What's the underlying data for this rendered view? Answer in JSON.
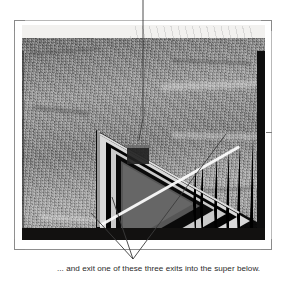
{
  "figure": {
    "caption": "... and exit one of these three exits into the super below.",
    "alt_description": "Black-and-white photograph of a triangular beehive entrance structure with nested triangular rings, apex pointing right",
    "medium": "scanned grayscale photograph",
    "colors": {
      "page_background": "#ffffff",
      "photo_midtone": "#8d8b87",
      "photo_shadow": "#121110",
      "photo_highlight": "#f4f1e8",
      "leader_line": "#3b3b3b",
      "crop_mark": "#8a8a8a",
      "caption_text": "#2a2a2a"
    },
    "annotations": {
      "top_pointer": {
        "name": "top-leader-line",
        "description": "vertical leader line from top edge down to the dark entrance block inside the triangle",
        "target": "entrance-block"
      },
      "bottom_pointer": {
        "name": "three-exit-leader-lines",
        "description": "three leader lines converging below the photograph at the caption",
        "count": 3,
        "targets": [
          "left-exit",
          "centre-exit",
          "right-exit"
        ]
      }
    },
    "structure": {
      "name": "nested-triangle",
      "ring_count": 6,
      "apex_direction": "right"
    },
    "marks": {
      "corner_brackets": 4,
      "registration_line_left": true,
      "registration_line_bottom": true,
      "registration_tick_right": true
    }
  }
}
